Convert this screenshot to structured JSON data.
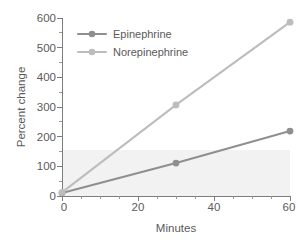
{
  "chart_data": {
    "type": "line",
    "title": "",
    "xlabel": "Minutes",
    "ylabel": "Percent change",
    "xlim": [
      0,
      60
    ],
    "ylim": [
      0,
      600
    ],
    "x": [
      0,
      30,
      60
    ],
    "xticks": [
      0,
      20,
      40,
      60
    ],
    "xtick_labels": [
      "0",
      "20",
      "40",
      "60"
    ],
    "yticks": [
      0,
      100,
      200,
      300,
      400,
      500,
      600
    ],
    "ytick_labels": [
      "0",
      "100",
      "200",
      "300",
      "400",
      "500",
      "600"
    ],
    "x_minor_step": 5,
    "y_minor_step": 50,
    "grid": false,
    "legend_position": "upper-left-inside",
    "series": [
      {
        "name": "Epinephrine",
        "values": [
          10,
          111,
          219
        ],
        "color": "#8f8f8f",
        "marker": "circle"
      },
      {
        "name": "Norepinephrine",
        "values": [
          12,
          307,
          586
        ],
        "color": "#bdbdbd",
        "marker": "circle"
      }
    ],
    "shaded_band": {
      "y_from": 0,
      "y_to": 155,
      "color": "#f2f2f2"
    }
  },
  "axes": {
    "y_title": "Percent change",
    "x_title": "Minutes",
    "y_tick_0": "0",
    "y_tick_1": "100",
    "y_tick_2": "200",
    "y_tick_3": "300",
    "y_tick_4": "400",
    "y_tick_5": "500",
    "y_tick_6": "600",
    "x_tick_0": "0",
    "x_tick_1": "20",
    "x_tick_2": "40",
    "x_tick_3": "60"
  },
  "legend": {
    "entries": [
      {
        "label": "Epinephrine",
        "color": "#8f8f8f"
      },
      {
        "label": "Norepinephrine",
        "color": "#bdbdbd"
      }
    ],
    "entry_0_label": "Epinephrine",
    "entry_1_label": "Norepinephrine"
  }
}
